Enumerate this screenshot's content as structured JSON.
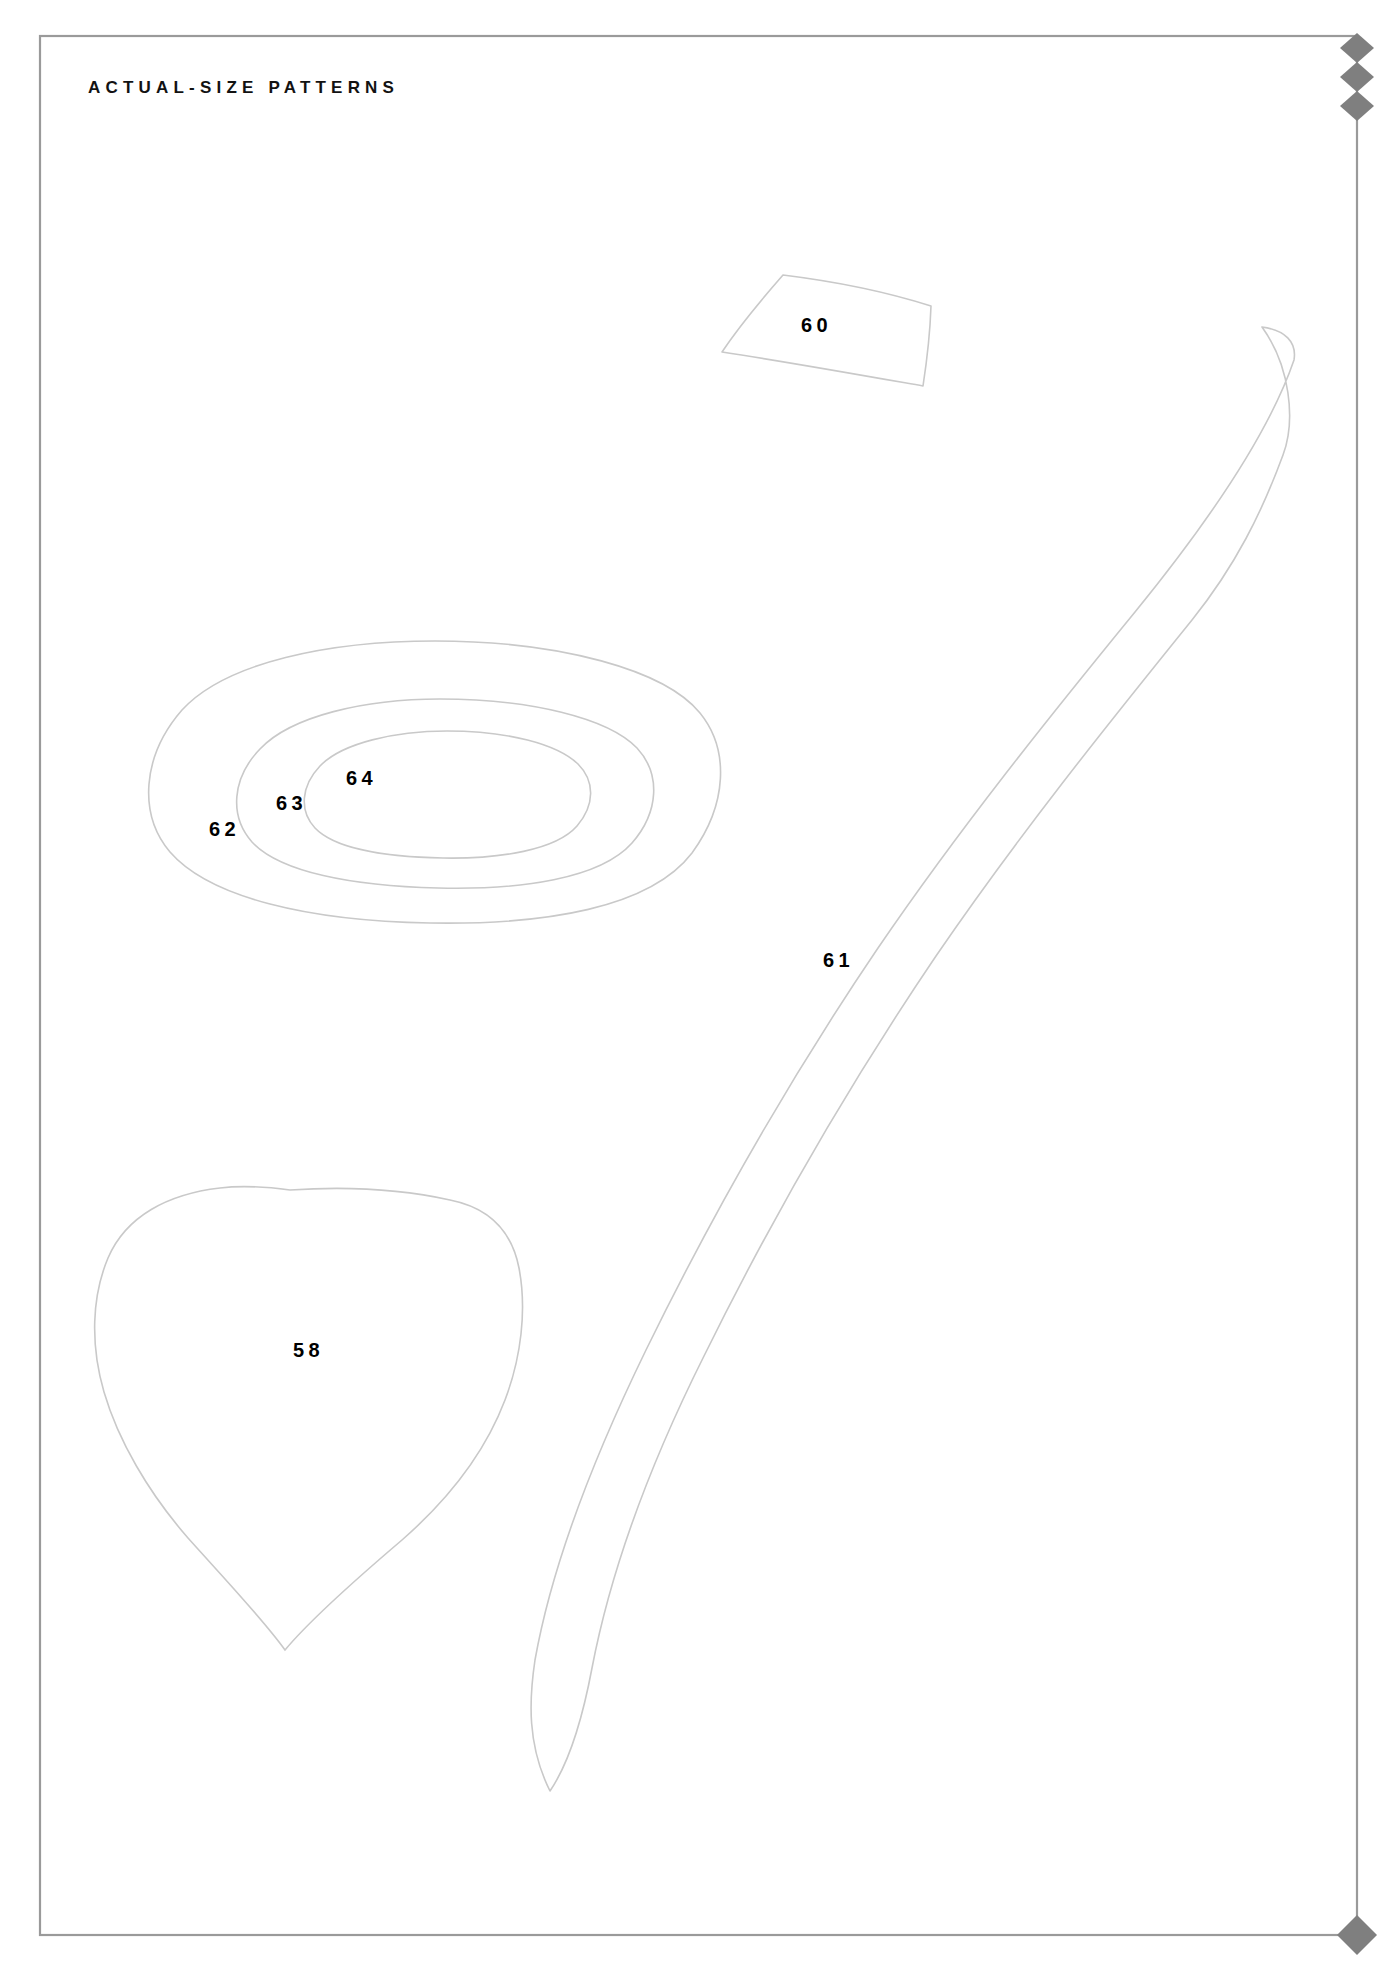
{
  "page": {
    "title": "ACTUAL-SIZE PATTERNS",
    "background_color": "#ffffff",
    "border_color": "#9a9a9a",
    "outline_color": "#c9c9c9",
    "label_color": "#000000",
    "marker_color": "#7f7f7f"
  },
  "corner_markers": {
    "top_right_icon": "diamond-marker",
    "top_right_count": 3,
    "bottom_right_icon": "diamond-marker",
    "bottom_right_count": 1
  },
  "pattern_pieces": [
    {
      "id": "60",
      "label": "60",
      "shape": "curved-quadrilateral",
      "description": "small four-sided panel with slightly bowed edges"
    },
    {
      "id": "61",
      "label": "61",
      "shape": "long-curved-strip",
      "description": "long narrow curved band tapering to a point at the lower end"
    },
    {
      "id": "62",
      "label": "62",
      "shape": "ellipse-outer",
      "description": "outermost of three concentric oval outlines"
    },
    {
      "id": "63",
      "label": "63",
      "shape": "ellipse-middle",
      "description": "middle of three concentric oval outlines"
    },
    {
      "id": "64",
      "label": "64",
      "shape": "ellipse-inner",
      "description": "innermost of three concentric oval outlines"
    },
    {
      "id": "58",
      "label": "58",
      "shape": "heart-leaf",
      "description": "rounded heart or leaf shape pointed at the bottom"
    }
  ]
}
